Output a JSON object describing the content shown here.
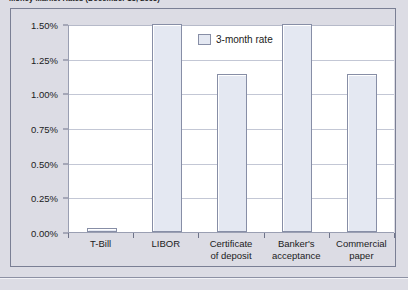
{
  "figure": {
    "title": "Money Market Rates (December 15, 2005)"
  },
  "legend": {
    "label": "3-month rate",
    "position": "inside-top-center"
  },
  "colors": {
    "page_background": "#dcdce4",
    "plot_background": "#ffffff",
    "bar_fill": "#e4e8f2",
    "bar_border": "#878ea6",
    "gridline": "#c3c7d5",
    "frame_border": "#7a7f94",
    "text": "#1b1b22"
  },
  "chart_data": {
    "type": "bar",
    "title": "Money Market Rates (December 15, 2005)",
    "xlabel": "",
    "ylabel": "",
    "categories": [
      "T-Bill",
      "Certificate of deposit",
      "Banker's acceptance",
      "Commercial paper",
      "LIBOR"
    ],
    "category_labels": [
      [
        "T-Bill"
      ],
      [
        "LIBOR"
      ],
      [
        "Certificate",
        "of deposit"
      ],
      [
        "Banker's",
        "acceptance"
      ],
      [
        "Commercial",
        "paper"
      ]
    ],
    "series": [
      {
        "name": "3-month rate",
        "categories": [
          "T-Bill",
          "LIBOR",
          "Certificate of deposit",
          "Banker's acceptance",
          "Commercial paper"
        ],
        "values": [
          0.03,
          1.5,
          1.14,
          1.5,
          1.14
        ]
      }
    ],
    "values": [
      0.03,
      1.5,
      1.14,
      1.5,
      1.14
    ],
    "ylim": [
      0.0,
      1.5
    ],
    "ytick_values": [
      0.0,
      0.25,
      0.5,
      0.75,
      1.0,
      1.25,
      1.5
    ],
    "ytick_labels": [
      "0.00%",
      "0.25%",
      "0.50%",
      "0.75%",
      "1.00%",
      "1.25%",
      "1.50%"
    ],
    "grid": true,
    "legend": "3-month rate",
    "legend_position": "inside-top-center",
    "value_unit": "percent"
  }
}
